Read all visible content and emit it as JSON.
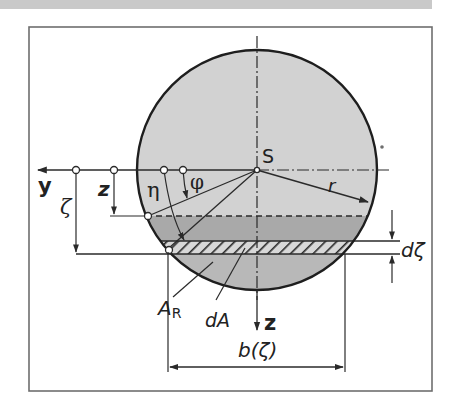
{
  "diagram": {
    "colors": {
      "background": "#ffffff",
      "top_band": "#c9c9c9",
      "frame": "#6e6e6e",
      "circle_fill": "#d2d2d2",
      "band_fill": "#a9a9a9",
      "lower_segment_fill": "#b8b8b8",
      "stroke": "#2a2a2a"
    },
    "labels": {
      "centroid": "S",
      "radius": "r",
      "y_axis": "y",
      "z_axis_bottom": "z",
      "z_dimension": "z",
      "zeta_dimension": "ζ",
      "eta_angle": "η",
      "phi_angle": "φ",
      "residual_area": "A",
      "residual_area_subscript": "R",
      "strip_area": "dA",
      "strip_thickness": "dζ",
      "strip_width": "b(ζ)"
    },
    "geometry": {
      "circle_center": [
        257,
        170
      ],
      "circle_radius": 120,
      "z_level_y": 216,
      "strip_top_y": 241,
      "strip_bottom_y": 254,
      "frame": [
        29,
        27,
        432,
        391
      ]
    }
  }
}
